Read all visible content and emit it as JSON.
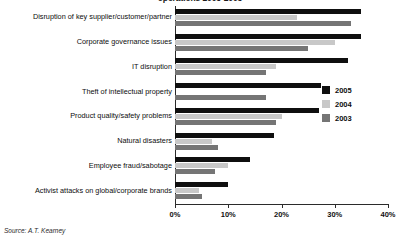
{
  "chart_data": {
    "type": "bar",
    "orientation": "horizontal",
    "title": "operations 2003-2005",
    "xlabel": "",
    "ylabel": "",
    "xlim": [
      0,
      40
    ],
    "grid": false,
    "legend_position": "right",
    "categories": [
      "Disruption of key supplier/customer/partner",
      "Corporate governance issues",
      "IT disruption",
      "Theft of intellectual property",
      "Product quality/safety problems",
      "Natural disasters",
      "Employee fraud/sabotage",
      "Activist attacks on global/corporate brands"
    ],
    "series": [
      {
        "name": "2005",
        "color": "#0f0f0f",
        "values": [
          35.0,
          35.0,
          32.5,
          27.5,
          27.0,
          18.5,
          14.0,
          10.0
        ]
      },
      {
        "name": "2004",
        "color": "#c8c8c8",
        "values": [
          23.0,
          30.0,
          19.0,
          0.0,
          20.0,
          7.0,
          10.0,
          4.5
        ]
      },
      {
        "name": "2003",
        "color": "#757575",
        "values": [
          33.0,
          25.0,
          17.0,
          17.0,
          19.0,
          8.0,
          7.5,
          5.0
        ]
      }
    ],
    "xticks": [
      0,
      10,
      20,
      30,
      40
    ],
    "xtick_labels": [
      "0%",
      "10%",
      "20%",
      "30%",
      "40%"
    ]
  },
  "legend": {
    "items": [
      {
        "label": "2005",
        "color": "#0f0f0f"
      },
      {
        "label": "2004",
        "color": "#c8c8c8"
      },
      {
        "label": "2003",
        "color": "#757575"
      }
    ]
  },
  "source_note": "Source: A.T. Kearney"
}
